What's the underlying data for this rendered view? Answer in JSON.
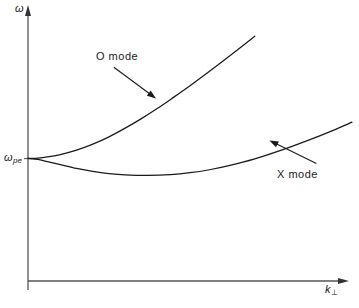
{
  "figure": {
    "background_color": "#ffffff",
    "line_color": "#1a1a1a",
    "axis_color": "#555555"
  },
  "axes": {
    "y_axis_label": "ω",
    "x_axis_label": "k",
    "x_axis_label_subscript": "⊥",
    "y_tick_label": "ω",
    "y_tick_label_subscript": "pe"
  },
  "annotations": {
    "o_mode_label": "O  mode",
    "x_mode_label": "X  mode"
  },
  "chart_data": {
    "type": "line",
    "title": "",
    "xlabel": "k⊥",
    "ylabel": "ω",
    "xlim": [
      0,
      1
    ],
    "ylim": [
      0,
      1
    ],
    "grid": false,
    "legend_position": "inline-annotation",
    "axis_ticks": {
      "y": [
        {
          "value": 0.45,
          "label": "ωpe"
        }
      ],
      "x": []
    },
    "series": [
      {
        "name": "O  mode",
        "comment": "Ordinary mode dispersion: starts at omega_pe at k=0 and rises monotonically, asymptotically linear",
        "points": [
          {
            "x": 0.0,
            "y": 0.451
          },
          {
            "x": 0.03,
            "y": 0.452
          },
          {
            "x": 0.06,
            "y": 0.456
          },
          {
            "x": 0.1,
            "y": 0.465
          },
          {
            "x": 0.15,
            "y": 0.481
          },
          {
            "x": 0.2,
            "y": 0.503
          },
          {
            "x": 0.25,
            "y": 0.53
          },
          {
            "x": 0.3,
            "y": 0.562
          },
          {
            "x": 0.35,
            "y": 0.597
          },
          {
            "x": 0.4,
            "y": 0.635
          },
          {
            "x": 0.45,
            "y": 0.676
          },
          {
            "x": 0.5,
            "y": 0.718
          },
          {
            "x": 0.55,
            "y": 0.762
          },
          {
            "x": 0.6,
            "y": 0.807
          },
          {
            "x": 0.65,
            "y": 0.853
          },
          {
            "x": 0.7,
            "y": 0.9
          }
        ]
      },
      {
        "name": "X  mode",
        "comment": "Extraordinary mode dispersion: starts at omega_pe, dips to a minimum near k=0.37 then rises",
        "points": [
          {
            "x": 0.0,
            "y": 0.451
          },
          {
            "x": 0.03,
            "y": 0.447
          },
          {
            "x": 0.06,
            "y": 0.439
          },
          {
            "x": 0.1,
            "y": 0.428
          },
          {
            "x": 0.15,
            "y": 0.414
          },
          {
            "x": 0.2,
            "y": 0.403
          },
          {
            "x": 0.25,
            "y": 0.395
          },
          {
            "x": 0.3,
            "y": 0.39
          },
          {
            "x": 0.37,
            "y": 0.388
          },
          {
            "x": 0.44,
            "y": 0.391
          },
          {
            "x": 0.5,
            "y": 0.398
          },
          {
            "x": 0.56,
            "y": 0.409
          },
          {
            "x": 0.62,
            "y": 0.424
          },
          {
            "x": 0.7,
            "y": 0.449
          },
          {
            "x": 0.78,
            "y": 0.48
          },
          {
            "x": 0.86,
            "y": 0.515
          },
          {
            "x": 0.94,
            "y": 0.553
          },
          {
            "x": 1.0,
            "y": 0.584
          }
        ]
      }
    ],
    "annotation_arrows": [
      {
        "label": "O  mode",
        "from": {
          "x": 0.265,
          "y": 0.786
        },
        "to": {
          "x": 0.395,
          "y": 0.671
        }
      },
      {
        "label": "X  mode",
        "from": {
          "x": 0.89,
          "y": 0.432
        },
        "to": {
          "x": 0.745,
          "y": 0.517
        }
      }
    ]
  }
}
